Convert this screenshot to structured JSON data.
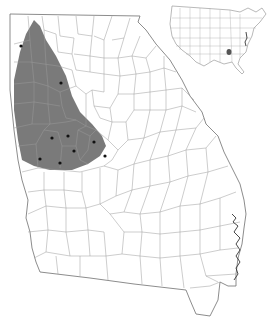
{
  "map": {
    "region": "Georgia",
    "subdivision": "counties",
    "colors": {
      "background": "#ffffff",
      "range_fill": "#7a7a7a",
      "county_border": "#9a9a9a",
      "state_border": "#6e6e6e",
      "occurrence_dot": "#111111"
    },
    "range": {
      "label": "shaded range (western Georgia)",
      "polygon": "20,52 26,34 34,20 40,26 46,40 56,56 66,76 72,96 80,112 92,124 102,136 106,146 100,156 88,164 72,170 50,170 34,166 22,160 18,140 14,110 14,80"
    },
    "occurrences": [
      {
        "x": 21,
        "y": 46
      },
      {
        "x": 61,
        "y": 83
      },
      {
        "x": 52,
        "y": 138
      },
      {
        "x": 68,
        "y": 136
      },
      {
        "x": 94,
        "y": 142
      },
      {
        "x": 74,
        "y": 151
      },
      {
        "x": 40,
        "y": 159
      },
      {
        "x": 60,
        "y": 163
      },
      {
        "x": 105,
        "y": 156
      }
    ],
    "inset": {
      "label": "United States inset",
      "highlight_state": "Georgia",
      "highlight_color": "#555555"
    }
  }
}
